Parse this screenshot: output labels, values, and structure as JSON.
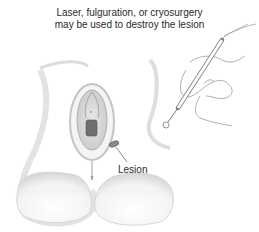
{
  "caption": {
    "line1": "Laser, fulguration, or cryosurgery",
    "line2": "may be used to destroy the lesion"
  },
  "labels": {
    "lesion": "Lesion"
  },
  "illustration": {
    "subject": "anatomical-drawing",
    "instrument": "probe-pen-icon",
    "hand": "hand-icon",
    "colors": {
      "line": "#9a9a9a",
      "shade": "#d8d8d8",
      "lesion": "#7a7a7a",
      "text": "#2a2a2a"
    }
  }
}
